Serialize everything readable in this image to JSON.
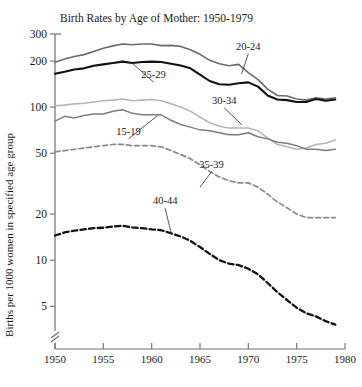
{
  "chart_data": {
    "type": "line",
    "title": "Birth Rates by Age of Mother: 1950-1979",
    "xlabel": "",
    "ylabel": "Births per 1000 women in specified age group",
    "yscale": "log",
    "ylim": [
      3.4,
      300
    ],
    "xlim": [
      1950,
      1980
    ],
    "grid": false,
    "legend_position": "inline-labels",
    "axis_break": "y-axis break near origin",
    "y_ticks": [
      300,
      200,
      100,
      50,
      20,
      10,
      5
    ],
    "y_tick_labels": [
      "300",
      "200",
      "100",
      "50",
      "20",
      "10",
      "5"
    ],
    "x_ticks": [
      1950,
      1955,
      1960,
      1965,
      1970,
      1975,
      1980
    ],
    "x_tick_labels": [
      "1950",
      "1955",
      "1960",
      "1965",
      "1970",
      "1975",
      "1980"
    ],
    "x": [
      1950,
      1951,
      1952,
      1953,
      1954,
      1955,
      1956,
      1957,
      1958,
      1959,
      1960,
      1961,
      1962,
      1963,
      1964,
      1965,
      1966,
      1967,
      1968,
      1969,
      1970,
      1971,
      1972,
      1973,
      1974,
      1975,
      1976,
      1977,
      1978,
      1979
    ],
    "series": [
      {
        "name": "20-24",
        "label": "20-24",
        "color": "#6b6b6b",
        "style": "solid",
        "width": 1.6,
        "values": [
          196,
          206,
          214,
          220,
          231,
          242,
          251,
          258,
          255,
          258,
          258,
          252,
          253,
          249,
          237,
          221,
          202,
          192,
          186,
          190,
          168,
          151,
          131,
          119,
          118,
          113,
          111,
          115,
          113,
          115
        ]
      },
      {
        "name": "25-29",
        "label": "25-29",
        "color": "#111111",
        "style": "solid",
        "width": 2.1,
        "values": [
          165,
          170,
          176,
          179,
          186,
          190,
          194,
          198,
          194,
          197,
          198,
          197,
          192,
          187,
          179,
          163,
          148,
          141,
          140,
          143,
          145,
          136,
          119,
          112,
          111,
          108,
          108,
          113,
          110,
          112
        ]
      },
      {
        "name": "30-34",
        "label": "30-34",
        "color": "#b5b5b5",
        "style": "solid",
        "width": 1.6,
        "values": [
          102,
          103,
          105,
          106,
          108,
          110,
          111,
          113,
          110,
          111,
          112,
          110,
          105,
          100,
          94,
          86,
          79,
          75,
          73,
          73,
          73,
          70,
          63,
          57,
          55,
          53,
          54,
          57,
          58,
          61
        ]
      },
      {
        "name": "15-19",
        "label": "15-19",
        "color": "#7d7d7d",
        "style": "solid",
        "width": 1.5,
        "values": [
          81,
          87,
          85,
          88,
          90,
          90,
          94,
          96,
          91,
          89,
          89,
          89,
          82,
          77,
          74,
          71,
          70,
          68,
          66,
          66,
          68,
          64,
          62,
          59,
          58,
          56,
          53,
          53,
          52,
          53
        ]
      },
      {
        "name": "35-39",
        "label": "35-39",
        "color": "#8a8a8a",
        "style": "dashed",
        "width": 1.7,
        "values": [
          51,
          52,
          53,
          54,
          55,
          56,
          57,
          57,
          56,
          56,
          56,
          55,
          52,
          49,
          46,
          42,
          38,
          35,
          33,
          32,
          32,
          30,
          27,
          24,
          22,
          20,
          19,
          19,
          19,
          19
        ]
      },
      {
        "name": "40-44",
        "label": "40-44",
        "color": "#121212",
        "style": "dashed",
        "width": 2.3,
        "values": [
          14.5,
          15.2,
          15.6,
          15.9,
          16.2,
          16.3,
          16.6,
          16.8,
          16.4,
          16.2,
          15.9,
          15.7,
          15.0,
          14.3,
          13.4,
          12.2,
          11.0,
          10.0,
          9.5,
          9.3,
          8.8,
          8.1,
          7.1,
          6.2,
          5.5,
          4.9,
          4.5,
          4.3,
          4.0,
          3.8
        ]
      }
    ],
    "annotations": [
      {
        "text": "20-24",
        "x": 1970.0,
        "y": 230.0,
        "leader_to_x": 1969.3,
        "leader_to_y": 165.0
      },
      {
        "text": "25-29",
        "x": 1960.2,
        "y": 150.0,
        "leader_to_x": 1958.0,
        "leader_to_y": 193.0
      },
      {
        "text": "30-34",
        "x": 1967.5,
        "y": 102.0,
        "leader_to_x": 1969.3,
        "leader_to_y": 77.0
      },
      {
        "text": "15-19",
        "x": 1957.6,
        "y": 64.0,
        "leader_to_x": 1960.6,
        "leader_to_y": 88.0
      },
      {
        "text": "35-39",
        "x": 1966.2,
        "y": 39.0,
        "leader_to_x": 1965.0,
        "leader_to_y": 30.0
      },
      {
        "text": "40-44",
        "x": 1961.4,
        "y": 22.5,
        "leader_to_x": 1962.0,
        "leader_to_y": 15.2
      }
    ]
  }
}
